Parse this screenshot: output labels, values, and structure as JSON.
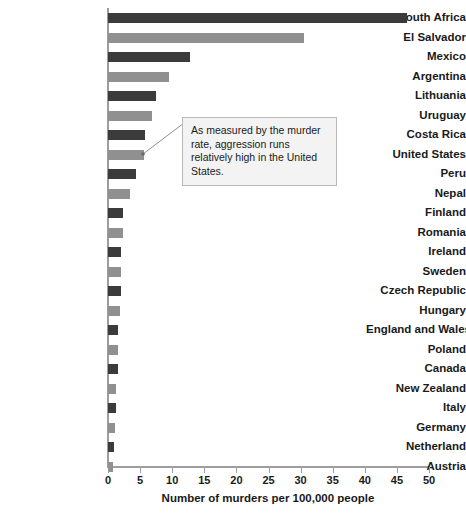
{
  "chart_data": {
    "type": "bar",
    "orientation": "horizontal",
    "title": "",
    "xlabel": "Number of murders per 100,000 people",
    "ylabel": "",
    "xlim": [
      0,
      50
    ],
    "xticks": [
      0,
      5,
      10,
      15,
      20,
      25,
      30,
      35,
      40,
      45,
      50
    ],
    "grid": false,
    "legend": "none",
    "categories": [
      "South Africa",
      "El Salvador",
      "Mexico",
      "Argentina",
      "Lithuania",
      "Uruguay",
      "Costa Rica",
      "United States",
      "Peru",
      "Nepal",
      "Finland",
      "Romania",
      "Ireland",
      "Sweden",
      "Czech Republic",
      "Hungary",
      "England and Wales",
      "Poland",
      "Canada",
      "New Zealand",
      "Italy",
      "Germany",
      "Netherland",
      "Austria"
    ],
    "values": [
      46.5,
      30.5,
      12.8,
      9.5,
      7.5,
      6.8,
      5.8,
      5.6,
      4.4,
      3.5,
      2.4,
      2.3,
      2.1,
      2.0,
      2.0,
      1.8,
      1.6,
      1.5,
      1.5,
      1.3,
      1.2,
      1.1,
      1.0,
      0.8
    ],
    "bar_colors": [
      "#3b3b3b",
      "#909090",
      "#3b3b3b",
      "#909090",
      "#3b3b3b",
      "#909090",
      "#3b3b3b",
      "#909090",
      "#3b3b3b",
      "#909090",
      "#3b3b3b",
      "#909090",
      "#3b3b3b",
      "#909090",
      "#3b3b3b",
      "#909090",
      "#3b3b3b",
      "#909090",
      "#3b3b3b",
      "#909090",
      "#3b3b3b",
      "#909090",
      "#3b3b3b",
      "#909090"
    ],
    "annotations": [
      {
        "text": "As measured by the murder rate, aggression runs relatively high in the United States.",
        "points_to": "United States"
      }
    ]
  },
  "colors": {
    "bar_dark": "#3b3b3b",
    "bar_light": "#909090",
    "axis": "#9d9d9d",
    "text": "#1a1a1a",
    "callout_bg": "#f3f3f3",
    "callout_border": "#b9b9b9"
  }
}
